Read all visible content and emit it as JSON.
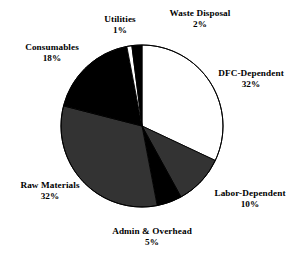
{
  "chart_data": {
    "type": "pie",
    "title": "",
    "subtitle": "",
    "xlabel": "",
    "ylabel": "",
    "legend_position": "none",
    "grid": false,
    "labels_show_percent": true,
    "start_angle_deg": 0,
    "direction": "clockwise",
    "categories": [
      "DFC-Dependent",
      "Labor-Dependent",
      "Admin & Overhead",
      "Raw Materials",
      "Consumables",
      "Utilities",
      "Waste Disposal"
    ],
    "values": [
      32,
      10,
      5,
      32,
      18,
      1,
      2
    ],
    "value_labels": [
      "32%",
      "10%",
      "5%",
      "32%",
      "18%",
      "1%",
      "2%"
    ],
    "colors": [
      "#ffffff",
      "#333333",
      "#000000",
      "#333333",
      "#000000",
      "#ffffff",
      "#000000"
    ],
    "stroke_color": "#000000",
    "slices": [
      {
        "label": "DFC-Dependent",
        "value": 32,
        "value_label": "32%",
        "color": "#ffffff"
      },
      {
        "label": "Labor-Dependent",
        "value": 10,
        "value_label": "10%",
        "color": "#333333"
      },
      {
        "label": "Admin & Overhead",
        "value": 5,
        "value_label": "5%",
        "color": "#000000"
      },
      {
        "label": "Raw Materials",
        "value": 32,
        "value_label": "32%",
        "color": "#333333"
      },
      {
        "label": "Consumables",
        "value": 18,
        "value_label": "18%",
        "color": "#000000"
      },
      {
        "label": "Utilities",
        "value": 1,
        "value_label": "1%",
        "color": "#ffffff"
      },
      {
        "label": "Waste Disposal",
        "value": 2,
        "value_label": "2%",
        "color": "#000000"
      }
    ],
    "total": 100,
    "units": "percent",
    "geometry": {
      "cx": 142,
      "cy": 126,
      "r": 81
    }
  },
  "canvas": {
    "background": "#ffffff",
    "width": 303,
    "height": 258
  }
}
